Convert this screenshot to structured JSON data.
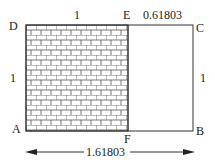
{
  "diagram": {
    "points": {
      "A": "A",
      "B": "B",
      "C": "C",
      "D": "D",
      "E": "E",
      "F": "F"
    },
    "dimensions": {
      "top_left_segment": "1",
      "top_right_segment": "0.61803",
      "left_side": "1",
      "right_side": "1",
      "total_width": "1.61803"
    },
    "fill_pattern": "brick",
    "colors": {
      "line": "#333333",
      "text": "#222222",
      "background": "#ffffff"
    }
  }
}
